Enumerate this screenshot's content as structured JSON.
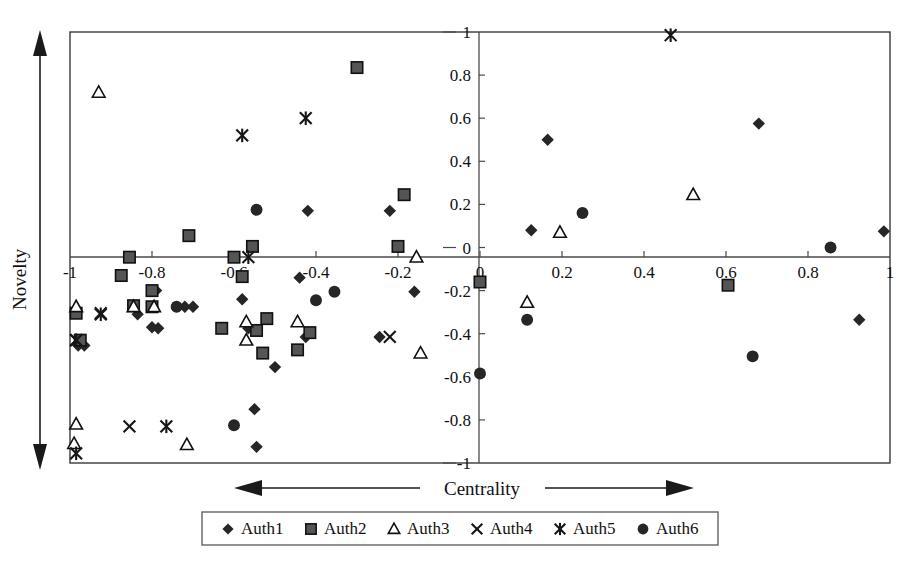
{
  "chart_data": {
    "type": "scatter",
    "title": "",
    "xlabel": "Centrality",
    "ylabel": "Novelty",
    "xlim": [
      -1,
      1
    ],
    "ylim": [
      -1,
      1
    ],
    "grid": false,
    "legend_position": "bottom",
    "x_ticks": [
      "-1",
      "-0.8",
      "-0.6",
      "-0.4",
      "-0.2",
      "0",
      "0.2",
      "0.4",
      "0.6",
      "0.8",
      "1"
    ],
    "x_tick_values": [
      -1,
      -0.8,
      -0.6,
      -0.4,
      -0.2,
      0,
      0.2,
      0.4,
      0.6,
      0.8,
      1
    ],
    "y_ticks": [
      "-1",
      "-0.8",
      "-0.6",
      "-0.4",
      "-0.2",
      "0",
      "0.2",
      "0.4",
      "0.6",
      "0.8",
      "1"
    ],
    "y_tick_values": [
      -1,
      -0.8,
      -0.6,
      -0.4,
      -0.2,
      0,
      0.2,
      0.4,
      0.6,
      0.8,
      1
    ],
    "axis_annotations": {
      "x_arrow": "double-headed horizontal arrow through Centrality label",
      "y_arrow": "double-headed vertical arrow beside Novelty label"
    },
    "series": [
      {
        "name": "Auth1",
        "marker": "diamond",
        "color": "#262626",
        "points": [
          [
            -0.42,
            0.17
          ],
          [
            -0.22,
            0.17
          ],
          [
            -0.44,
            -0.14
          ],
          [
            -0.79,
            -0.2
          ],
          [
            -0.58,
            -0.24
          ],
          [
            -0.72,
            -0.275
          ],
          [
            -0.7,
            -0.275
          ],
          [
            -0.565,
            -0.375
          ],
          [
            -0.835,
            -0.31
          ],
          [
            -0.8,
            -0.37
          ],
          [
            -0.785,
            -0.375
          ],
          [
            -0.98,
            -0.455
          ],
          [
            -0.965,
            -0.455
          ],
          [
            -0.425,
            -0.415
          ],
          [
            -0.245,
            -0.415
          ],
          [
            -0.16,
            -0.205
          ],
          [
            -0.5,
            -0.555
          ],
          [
            -0.55,
            -0.75
          ],
          [
            -0.545,
            -0.925
          ],
          [
            0.125,
            0.08
          ],
          [
            0.165,
            0.5
          ],
          [
            0.68,
            0.575
          ],
          [
            0.985,
            0.075
          ],
          [
            0.925,
            -0.335
          ]
        ]
      },
      {
        "name": "Auth2",
        "marker": "square",
        "color": "#555555",
        "points": [
          [
            -0.3,
            0.835
          ],
          [
            -0.71,
            0.055
          ],
          [
            -0.185,
            0.245
          ],
          [
            -0.555,
            0.005
          ],
          [
            -0.2,
            0.005
          ],
          [
            -0.855,
            -0.045
          ],
          [
            -0.6,
            -0.045
          ],
          [
            -0.875,
            -0.13
          ],
          [
            -0.58,
            -0.135
          ],
          [
            -0.8,
            -0.2
          ],
          [
            -0.845,
            -0.27
          ],
          [
            -0.8,
            -0.275
          ],
          [
            -0.985,
            -0.305
          ],
          [
            -0.975,
            -0.43
          ],
          [
            -0.52,
            -0.33
          ],
          [
            -0.545,
            -0.385
          ],
          [
            -0.415,
            -0.395
          ],
          [
            -0.63,
            -0.375
          ],
          [
            -0.445,
            -0.475
          ],
          [
            -0.53,
            -0.49
          ],
          [
            0.0,
            -0.16
          ],
          [
            0.605,
            -0.175
          ]
        ]
      },
      {
        "name": "Auth3",
        "marker": "triangle",
        "color": "#111111",
        "points": [
          [
            -0.93,
            0.72
          ],
          [
            -0.155,
            -0.045
          ],
          [
            -0.985,
            -0.275
          ],
          [
            -0.845,
            -0.275
          ],
          [
            -0.795,
            -0.275
          ],
          [
            -0.57,
            -0.345
          ],
          [
            -0.445,
            -0.345
          ],
          [
            -0.57,
            -0.43
          ],
          [
            -0.145,
            -0.49
          ],
          [
            -0.985,
            -0.82
          ],
          [
            -0.99,
            -0.91
          ],
          [
            -0.715,
            -0.915
          ],
          [
            0.195,
            0.07
          ],
          [
            0.52,
            0.245
          ],
          [
            0.115,
            -0.255
          ]
        ]
      },
      {
        "name": "Auth4",
        "marker": "x",
        "color": "#161616",
        "points": [
          [
            -0.925,
            -0.305
          ],
          [
            -0.985,
            -0.43
          ],
          [
            -0.855,
            -0.83
          ],
          [
            -0.22,
            -0.415
          ]
        ]
      },
      {
        "name": "Auth5",
        "marker": "star6",
        "color": "#161616",
        "points": [
          [
            -0.58,
            0.52
          ],
          [
            -0.425,
            0.6
          ],
          [
            -0.565,
            -0.045
          ],
          [
            -0.925,
            -0.31
          ],
          [
            -0.985,
            -0.43
          ],
          [
            -0.765,
            -0.83
          ],
          [
            -0.985,
            -0.955
          ],
          [
            0.465,
            0.985
          ]
        ]
      },
      {
        "name": "Auth6",
        "marker": "circle",
        "color": "#262626",
        "points": [
          [
            -0.545,
            0.175
          ],
          [
            -0.74,
            -0.275
          ],
          [
            -0.355,
            -0.205
          ],
          [
            -0.4,
            -0.245
          ],
          [
            -0.6,
            -0.825
          ],
          [
            0.25,
            0.16
          ],
          [
            0.855,
            0.0
          ],
          [
            0.0,
            -0.585
          ],
          [
            0.115,
            -0.335
          ],
          [
            0.665,
            -0.505
          ]
        ]
      }
    ]
  },
  "legend": {
    "items": [
      {
        "label": "Auth1",
        "marker": "diamond"
      },
      {
        "label": "Auth2",
        "marker": "square"
      },
      {
        "label": "Auth3",
        "marker": "triangle"
      },
      {
        "label": "Auth4",
        "marker": "x"
      },
      {
        "label": "Auth5",
        "marker": "star6"
      },
      {
        "label": "Auth6",
        "marker": "circle"
      }
    ]
  }
}
